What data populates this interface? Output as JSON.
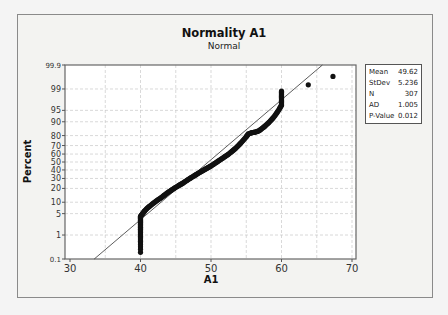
{
  "chart_data": {
    "type": "scatter",
    "title": "Normality A1",
    "subtitle": "Normal",
    "xlabel": "A1",
    "ylabel": "Percent",
    "xlim": [
      30,
      70
    ],
    "x_ticks": [
      30,
      40,
      50,
      60,
      70
    ],
    "y_scale": "normal-probability",
    "y_ticks": [
      0.1,
      1,
      5,
      10,
      20,
      30,
      40,
      50,
      60,
      70,
      80,
      90,
      95,
      99,
      99.9
    ],
    "grid": true,
    "fit_line": {
      "mean": 49.62,
      "stdev": 5.236
    },
    "legend_position": "right",
    "stats": [
      {
        "label": "Mean",
        "value": "49.62"
      },
      {
        "label": "StDev",
        "value": "5.236"
      },
      {
        "label": "N",
        "value": "307"
      },
      {
        "label": "AD",
        "value": "1.005"
      },
      {
        "label": "P-Value",
        "value": "0.012"
      }
    ],
    "points": [
      [
        40,
        0.2
      ],
      [
        40,
        0.5
      ],
      [
        40,
        0.8
      ],
      [
        40,
        1.2
      ],
      [
        40,
        1.6
      ],
      [
        40,
        2.0
      ],
      [
        40,
        2.5
      ],
      [
        40,
        3.0
      ],
      [
        40,
        3.6
      ],
      [
        40,
        4.2
      ],
      [
        40.3,
        5.0
      ],
      [
        40.6,
        6.0
      ],
      [
        41,
        7.2
      ],
      [
        41.5,
        8.5
      ],
      [
        42,
        10
      ],
      [
        42.5,
        11.5
      ],
      [
        43,
        13
      ],
      [
        43.5,
        15
      ],
      [
        44,
        17
      ],
      [
        44.5,
        19
      ],
      [
        45,
        21
      ],
      [
        45.5,
        23
      ],
      [
        46,
        25
      ],
      [
        46.5,
        27.5
      ],
      [
        47,
        30
      ],
      [
        47.5,
        32.5
      ],
      [
        48,
        35
      ],
      [
        48.5,
        37.5
      ],
      [
        49,
        40
      ],
      [
        49.5,
        42.5
      ],
      [
        50,
        45
      ],
      [
        50.5,
        48
      ],
      [
        51,
        51
      ],
      [
        51.5,
        54
      ],
      [
        52,
        57
      ],
      [
        52.5,
        60
      ],
      [
        53,
        63.5
      ],
      [
        53.5,
        67
      ],
      [
        54,
        71
      ],
      [
        54.5,
        75
      ],
      [
        55,
        79
      ],
      [
        55.3,
        81.5
      ],
      [
        55.8,
        82.5
      ],
      [
        56.3,
        83
      ],
      [
        56.8,
        84
      ],
      [
        57.3,
        86
      ],
      [
        57.8,
        88
      ],
      [
        58.3,
        90
      ],
      [
        58.8,
        92
      ],
      [
        59.3,
        94
      ],
      [
        59.7,
        95.5
      ],
      [
        60,
        96.5
      ],
      [
        60,
        97.2
      ],
      [
        60,
        97.8
      ],
      [
        60,
        98.3
      ],
      [
        60,
        98.8
      ],
      [
        63.8,
        99.3
      ],
      [
        67.3,
        99.68
      ]
    ]
  }
}
